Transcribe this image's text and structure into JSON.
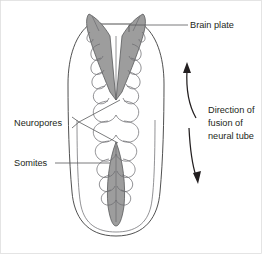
{
  "figure": {
    "background_color": "#ffffff",
    "width": 262,
    "height": 254
  },
  "colors": {
    "plate_fill": "#9d9d9d",
    "outline_stroke": "#3c3c3c",
    "leader_stroke": "#58595b",
    "text": "#231f20",
    "frame": "#d9d9d9"
  },
  "labels": {
    "brain_plate": "Brain plate",
    "neuropores": "Neuropores",
    "somites": "Somites",
    "direction_line1": "Direction of",
    "direction_line2": "fusion of",
    "direction_line3": "neural tube"
  },
  "structures": {
    "brain_plate": "V-shaped shaded brain plate at cranial end",
    "anterior_neuropore": "shaded wedge narrowing caudally from brain plate",
    "posterior_neuropore": "shaded spindle at caudal end",
    "somites": "paired scalloped blocks flanking the neural groove",
    "embryo_outline": "elongated oval embryo body outline"
  },
  "annotations": {
    "arrow_up": "curved arrow pointing cranially",
    "arrow_down": "curved arrow pointing caudally"
  }
}
